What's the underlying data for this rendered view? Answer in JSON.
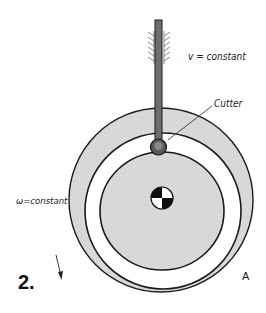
{
  "figure": {
    "number": "2.",
    "point_label": "A"
  },
  "labels": {
    "velocity": "v = constant",
    "cutter": "Cutter",
    "angular_velocity": "ω=constant"
  },
  "colors": {
    "disk_fill": "#d9d9d9",
    "groove_fill": "#ffffff",
    "rod_fill": "#6e6e6e",
    "outline": "#1a1a1a"
  }
}
